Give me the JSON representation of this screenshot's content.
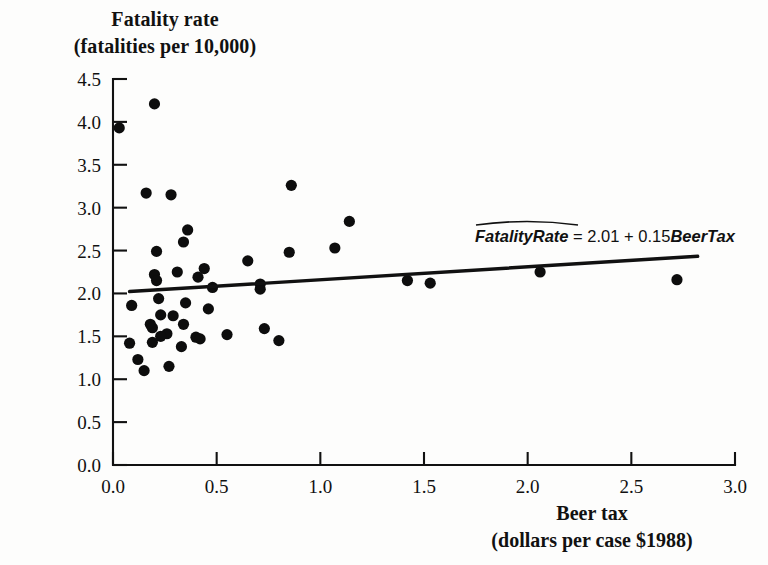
{
  "chart_data": {
    "type": "scatter",
    "title": "",
    "ylabel": "Fatality rate (fatalities per 10,000)",
    "ylabel_line1": "Fatality rate",
    "ylabel_line2": "(fatalities per 10,000)",
    "xlabel": "Beer tax (dollars per case $1988)",
    "xlabel_line1": "Beer tax",
    "xlabel_line2": "(dollars per case $1988)",
    "xlim": [
      0.0,
      3.0
    ],
    "ylim": [
      0.0,
      4.5
    ],
    "xticks": [
      0.0,
      0.5,
      1.0,
      1.5,
      2.0,
      2.5,
      3.0
    ],
    "xtick_labels": [
      "0.0",
      "0.5",
      "1.0",
      "1.5",
      "2.0",
      "2.5",
      "3.0"
    ],
    "yticks": [
      0.0,
      0.5,
      1.0,
      1.5,
      2.0,
      2.5,
      3.0,
      3.5,
      4.0,
      4.5
    ],
    "ytick_labels": [
      "0.0",
      "0.5",
      "1.0",
      "1.5",
      "2.0",
      "2.5",
      "3.0",
      "3.5",
      "4.0",
      "4.5"
    ],
    "grid": false,
    "legend": false,
    "marker_color": "#0d0d0d",
    "marker_size": 5.6,
    "line_color": "#111111",
    "annotation": {
      "text": "FatalityRate = 2.01 + 0.15BeerTax",
      "lhs": "FatalityRate",
      "equals": "=",
      "intercept": "2.01",
      "plus": "+",
      "slope": "0.15",
      "regressor": "BeerTax",
      "hat": true
    },
    "fit_line": {
      "intercept": 2.01,
      "slope": 0.15,
      "x_start": 0.08,
      "x_end": 2.82
    },
    "points": [
      {
        "x": 0.03,
        "y": 3.93
      },
      {
        "x": 0.2,
        "y": 4.21
      },
      {
        "x": 0.16,
        "y": 3.17
      },
      {
        "x": 0.28,
        "y": 3.15
      },
      {
        "x": 0.86,
        "y": 3.26
      },
      {
        "x": 1.14,
        "y": 2.84
      },
      {
        "x": 0.36,
        "y": 2.74
      },
      {
        "x": 0.34,
        "y": 2.6
      },
      {
        "x": 1.07,
        "y": 2.53
      },
      {
        "x": 0.21,
        "y": 2.49
      },
      {
        "x": 0.85,
        "y": 2.48
      },
      {
        "x": 0.65,
        "y": 2.38
      },
      {
        "x": 0.44,
        "y": 2.29
      },
      {
        "x": 0.31,
        "y": 2.25
      },
      {
        "x": 0.2,
        "y": 2.22
      },
      {
        "x": 0.41,
        "y": 2.19
      },
      {
        "x": 2.72,
        "y": 2.16
      },
      {
        "x": 0.21,
        "y": 2.15
      },
      {
        "x": 1.42,
        "y": 2.15
      },
      {
        "x": 1.53,
        "y": 2.12
      },
      {
        "x": 0.71,
        "y": 2.11
      },
      {
        "x": 2.06,
        "y": 2.25
      },
      {
        "x": 0.48,
        "y": 2.07
      },
      {
        "x": 0.71,
        "y": 2.05
      },
      {
        "x": 0.22,
        "y": 1.94
      },
      {
        "x": 0.35,
        "y": 1.89
      },
      {
        "x": 0.09,
        "y": 1.86
      },
      {
        "x": 0.46,
        "y": 1.82
      },
      {
        "x": 0.23,
        "y": 1.75
      },
      {
        "x": 0.29,
        "y": 1.74
      },
      {
        "x": 0.34,
        "y": 1.64
      },
      {
        "x": 0.18,
        "y": 1.64
      },
      {
        "x": 0.19,
        "y": 1.6
      },
      {
        "x": 0.73,
        "y": 1.59
      },
      {
        "x": 0.26,
        "y": 1.53
      },
      {
        "x": 0.23,
        "y": 1.5
      },
      {
        "x": 0.4,
        "y": 1.49
      },
      {
        "x": 0.55,
        "y": 1.52
      },
      {
        "x": 0.42,
        "y": 1.47
      },
      {
        "x": 0.8,
        "y": 1.45
      },
      {
        "x": 0.19,
        "y": 1.43
      },
      {
        "x": 0.08,
        "y": 1.42
      },
      {
        "x": 0.33,
        "y": 1.38
      },
      {
        "x": 0.12,
        "y": 1.23
      },
      {
        "x": 0.27,
        "y": 1.15
      },
      {
        "x": 0.15,
        "y": 1.1
      }
    ]
  }
}
